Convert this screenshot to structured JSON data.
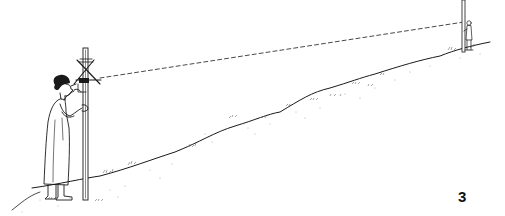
{
  "figure": {
    "number": "3",
    "colors": {
      "background": "#ffffff",
      "ink": "#1a1a1a",
      "stipple": "#9a9a9a"
    },
    "elements": {
      "observer": "woman-with-sighting-pole",
      "instrument": "crossed-stick-sight",
      "sight_line": "dashed-line",
      "terrain": "sloping-hill",
      "assistant": "distant-person-with-staff"
    }
  }
}
